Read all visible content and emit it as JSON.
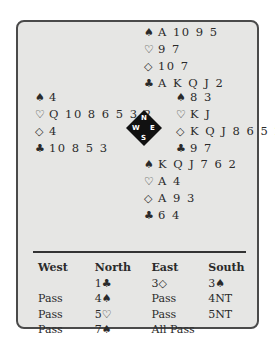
{
  "deal": {
    "north": {
      "spades": "A 10 9 5",
      "hearts": "9 7",
      "diamonds": "10 7",
      "clubs": "A K Q J 2"
    },
    "west": {
      "spades": "4",
      "hearts": "Q 10 8 6 5 3 2",
      "diamonds": "4",
      "clubs": "10 8 5 3"
    },
    "east": {
      "spades": "8 3",
      "hearts": "K J",
      "diamonds": "K Q J 8 6 5 2",
      "clubs": "9 7"
    },
    "south": {
      "spades": "K Q J 7 6 2",
      "hearts": "A 4",
      "diamonds": "A 9 3",
      "clubs": "6 4"
    }
  },
  "suit_symbols": {
    "spades": "♠",
    "hearts": "♡",
    "diamonds": "◇",
    "clubs": "♣"
  },
  "compass": {
    "n": "N",
    "e": "E",
    "s": "S",
    "w": "W"
  },
  "auction": {
    "headers": [
      "West",
      "North",
      "East",
      "South"
    ],
    "rows": [
      [
        "",
        "1♣",
        "3◇",
        "3♠"
      ],
      [
        "Pass",
        "4♠",
        "Pass",
        "4NT"
      ],
      [
        "Pass",
        "5♡",
        "Pass",
        "5NT"
      ],
      [
        "Pass",
        "7♠",
        "All Pass",
        ""
      ]
    ]
  }
}
